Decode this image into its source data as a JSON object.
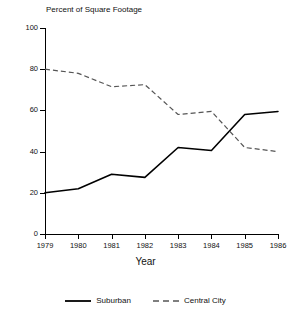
{
  "chart_data": {
    "type": "line",
    "title": "Percent of Square Footage",
    "subtitle": "",
    "xlabel": "Year",
    "ylabel": "",
    "x": [
      1979,
      1980,
      1981,
      1982,
      1983,
      1984,
      1985,
      1986
    ],
    "categories": [
      "1979",
      "1980",
      "1981",
      "1982",
      "1983",
      "1984",
      "1985",
      "1986"
    ],
    "series": [
      {
        "name": "Suburban",
        "style": "solid",
        "color": "#000000",
        "values": [
          20,
          22,
          29,
          27.5,
          42,
          40.5,
          58,
          59.5
        ]
      },
      {
        "name": "Central City",
        "style": "dashed",
        "color": "#555555",
        "values": [
          80,
          78,
          71.5,
          72.5,
          58,
          59.5,
          42,
          40
        ]
      }
    ],
    "xlim": [
      1979,
      1986
    ],
    "ylim": [
      0,
      100
    ],
    "yticks": [
      0,
      20,
      40,
      60,
      80,
      100
    ],
    "ytick_labels": [
      "0",
      "20",
      "40",
      "60",
      "80",
      "100"
    ],
    "xticks": [
      1979,
      1980,
      1981,
      1982,
      1983,
      1984,
      1985,
      1986
    ],
    "grid": false,
    "legend_position": "bottom-center",
    "annotations": []
  },
  "legend": {
    "entries": [
      {
        "label": "Suburban",
        "swatch": "solid-line-swatch"
      },
      {
        "label": "Central City",
        "swatch": "dashed-line-swatch"
      }
    ]
  },
  "colors": {
    "background": "#ffffff",
    "axis": "#000000",
    "text": "#111111",
    "suburban_line": "#000000",
    "central_city_line": "#555555"
  }
}
